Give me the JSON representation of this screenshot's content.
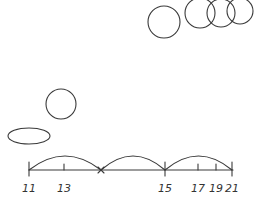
{
  "diagram": {
    "title": "",
    "stroke_color": "#3a3a3a",
    "background": "#ffffff",
    "top_circles": [
      {
        "cx": 164,
        "cy": 22,
        "r": 16
      },
      {
        "cx": 200,
        "cy": 13,
        "r": 15
      },
      {
        "cx": 221,
        "cy": 13,
        "r": 14
      },
      {
        "cx": 240,
        "cy": 11,
        "r": 13
      }
    ],
    "lone_circle": {
      "cx": 61,
      "cy": 104,
      "r": 15
    },
    "ellipse": {
      "cx": 29,
      "cy": 136,
      "rx": 21,
      "ry": 8
    },
    "number_line": {
      "y": 170,
      "x_start": 29,
      "x_end": 233,
      "ticks": [
        {
          "value": "11",
          "x": 29
        },
        {
          "value": "13",
          "x": 64
        },
        {
          "value": "15",
          "x": 165
        },
        {
          "value": "17",
          "x": 198
        },
        {
          "value": "19",
          "x": 216
        },
        {
          "value": "21",
          "x": 232
        }
      ],
      "cross_mark_x": 101,
      "arcs": [
        {
          "from": 29,
          "to": 101
        },
        {
          "from": 101,
          "to": 165
        },
        {
          "from": 165,
          "to": 232
        }
      ]
    }
  }
}
